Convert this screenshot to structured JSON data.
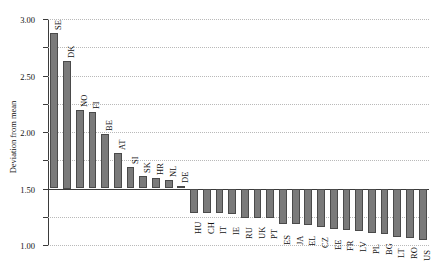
{
  "chart_data": {
    "type": "bar",
    "title": "",
    "xlabel": "",
    "ylabel": "Deviation from mean",
    "ylim": [
      -1.0,
      3.0
    ],
    "ytick_labels": [
      "3.00",
      "2.50",
      "2.00",
      "1.50",
      "1.00",
      "0.50",
      "0.00",
      "-0.50",
      "-1.00"
    ],
    "ytick_values": [
      3.0,
      2.5,
      2.0,
      1.5,
      1.0,
      0.5,
      0.0,
      -0.5,
      -1.0
    ],
    "grid": true,
    "legend": false,
    "bar_color": "#7a7a7a",
    "bar_edge_color": "#4a4a4a",
    "axis_color": "#3b3b3b",
    "gridline_color": "#b9b9b9",
    "categories": [
      "SE",
      "DK",
      "NO",
      "FI",
      "BE",
      "AT",
      "SI",
      "SK",
      "HR",
      "NL",
      "DE",
      "HU",
      "CH",
      "IT",
      "IE",
      "RU",
      "UK",
      "PT",
      "ES",
      "JA",
      "EL",
      "CZ",
      "EE",
      "FR",
      "LV",
      "PL",
      "BG",
      "LT",
      "RO",
      "US"
    ],
    "values": [
      2.76,
      2.25,
      1.39,
      1.35,
      0.97,
      0.63,
      0.38,
      0.22,
      0.19,
      0.15,
      0.04,
      -0.43,
      -0.43,
      -0.44,
      -0.45,
      -0.52,
      -0.52,
      -0.53,
      -0.63,
      -0.63,
      -0.64,
      -0.68,
      -0.72,
      -0.74,
      -0.75,
      -0.79,
      -0.81,
      -0.85,
      -0.88,
      -0.92
    ]
  }
}
